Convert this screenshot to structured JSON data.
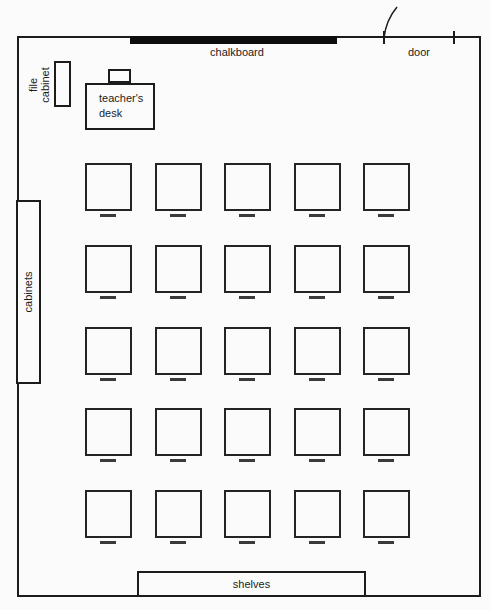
{
  "diagram": {
    "type": "classroom-floor-plan",
    "labels": {
      "chalkboard": "chalkboard",
      "door": "door",
      "file_cabinet_line1": "file",
      "file_cabinet_line2": "cabinet",
      "teachers_desk_line1": "teacher's",
      "teachers_desk_line2": "desk",
      "cabinets": "cabinets",
      "shelves": "shelves"
    },
    "desk_grid": {
      "rows": 5,
      "cols": 5,
      "total_desks": 25
    },
    "colors": {
      "line": "#1c1c1c",
      "chalkboard_fill": "#0d0d0d",
      "background": "#fbfbfb"
    }
  }
}
